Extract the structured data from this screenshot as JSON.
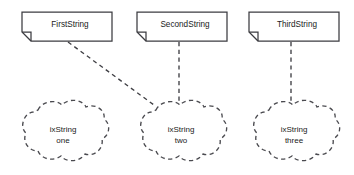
{
  "diagram": {
    "background_color": "#ffffff",
    "line_color": "#3c3c41",
    "text_color": "#1a1a1a",
    "notes": [
      {
        "id": "first-string",
        "label": "FirstString",
        "x": 22,
        "y": 12,
        "width": 90,
        "height": 29,
        "fold_size": 9
      },
      {
        "id": "second-string",
        "label": "SecondString",
        "x": 137,
        "y": 12,
        "width": 90,
        "height": 29,
        "fold_size": 9
      },
      {
        "id": "third-string",
        "label": "ThirdString",
        "x": 249,
        "y": 12,
        "width": 90,
        "height": 29,
        "fold_size": 9
      }
    ],
    "clouds": [
      {
        "id": "ix-string-one",
        "label_line1": "ixString",
        "label_line2": "one",
        "cx": 62,
        "cy": 134,
        "rx": 47,
        "ry": 30
      },
      {
        "id": "ix-string-two",
        "label_line1": "ixString",
        "label_line2": "two",
        "cx": 180,
        "cy": 134,
        "rx": 47,
        "ry": 30
      },
      {
        "id": "ix-string-three",
        "label_line1": "ixString",
        "label_line2": "three",
        "cx": 293,
        "cy": 134,
        "rx": 47,
        "ry": 30
      }
    ],
    "connectors": [
      {
        "id": "first-to-two",
        "from": "first-string",
        "to": "ix-string-two",
        "style": "dashed",
        "x1": 68,
        "y1": 42,
        "x2": 154,
        "y2": 105
      },
      {
        "id": "second-to-two",
        "from": "second-string",
        "to": "ix-string-two",
        "style": "dashed",
        "x1": 179,
        "y1": 42,
        "x2": 179,
        "y2": 105
      },
      {
        "id": "third-to-three",
        "from": "third-string",
        "to": "ix-string-three",
        "style": "dashed",
        "x1": 291,
        "y1": 42,
        "x2": 291,
        "y2": 105
      }
    ]
  }
}
